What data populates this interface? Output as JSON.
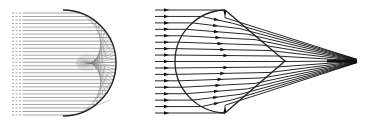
{
  "figure": {
    "panels": [
      {
        "id": "left",
        "label": "Parallel rays reflected by a spherical (semicircular) mirror forming a caustic",
        "ray_count": 30,
        "ray_x_start": 12,
        "ray_y_top": 13,
        "ray_y_bottom": 115,
        "mirror_center": [
          63,
          63
        ],
        "mirror_radius": 53,
        "ray_color": "#8c8c8c",
        "mirror_color": "#222222",
        "caustic_color": "#777777"
      },
      {
        "id": "right",
        "label": "Parallel rays refracted by a lens, converging with caustic toward focus",
        "ray_count": 17,
        "ray_x_start": 155,
        "ray_y_top": 10,
        "ray_y_bottom": 113,
        "lens_front_apex_x": 175,
        "lens_edge_x": 225,
        "lens_back_apex": [
          285,
          61
        ],
        "focus_tail_end": [
          357,
          61
        ],
        "ray_color": "#111111",
        "lens_color": "#222222",
        "arrow_icon": "triangle-arrowhead"
      }
    ]
  }
}
